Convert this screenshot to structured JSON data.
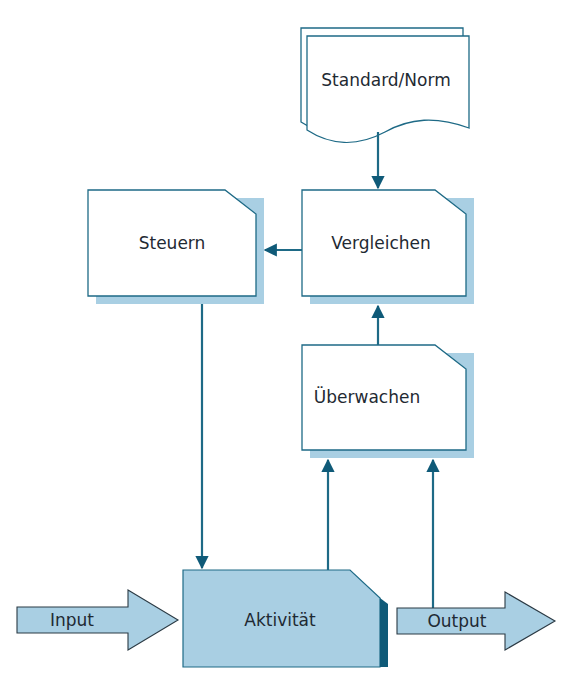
{
  "diagram": {
    "type": "control-loop flowchart",
    "colors": {
      "line": "#1e6a86",
      "arrow": "#0f5a78",
      "shadow": "#a9cfe3",
      "activity_fill": "#a9cfe3",
      "activity_edge": "#0f5a78",
      "box_fill": "#ffffff",
      "text": "#1f2a33"
    },
    "nodes": {
      "standard": {
        "label": "Standard/Norm",
        "shape": "document-stack"
      },
      "vergleichen": {
        "label": "Vergleichen",
        "shape": "cut-corner-box"
      },
      "steuern": {
        "label": "Steuern",
        "shape": "cut-corner-box"
      },
      "ueberwachen": {
        "label": "Überwachen",
        "shape": "cut-corner-box"
      },
      "aktivitaet": {
        "label": "Aktivität",
        "shape": "cut-corner-box-filled"
      },
      "input": {
        "label": "Input",
        "shape": "block-arrow"
      },
      "output": {
        "label": "Output",
        "shape": "block-arrow"
      }
    },
    "edges": [
      {
        "from": "Standard/Norm",
        "to": "Vergleichen"
      },
      {
        "from": "Vergleichen",
        "to": "Steuern"
      },
      {
        "from": "Überwachen",
        "to": "Vergleichen"
      },
      {
        "from": "Steuern",
        "to": "Aktivität"
      },
      {
        "from": "Aktivität",
        "to": "Überwachen"
      },
      {
        "from": "Output",
        "to": "Überwachen"
      },
      {
        "from": "Input",
        "to": "Aktivität"
      },
      {
        "from": "Aktivität",
        "to": "Output"
      }
    ]
  }
}
